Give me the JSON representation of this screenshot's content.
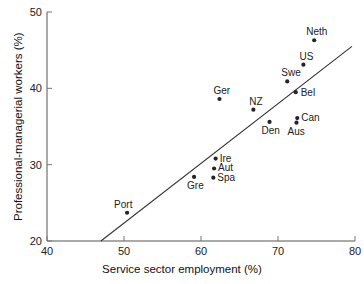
{
  "chart_data": {
    "type": "scatter",
    "title": "",
    "xlabel": "Service sector employment (%)",
    "ylabel": "Professional-managerial workers (%)",
    "xlim": [
      40,
      80
    ],
    "ylim": [
      20,
      50
    ],
    "xticks": [
      40,
      50,
      60,
      70,
      80
    ],
    "yticks": [
      20,
      30,
      40,
      50
    ],
    "grid": false,
    "legend": "none",
    "points": [
      {
        "label": "Port",
        "x": 50.4,
        "y": 23.7,
        "label_dx": -13,
        "label_dy": -14
      },
      {
        "label": "Gre",
        "x": 59.1,
        "y": 28.4,
        "label_dx": -7,
        "label_dy": 3
      },
      {
        "label": "Spa",
        "x": 61.6,
        "y": 28.3,
        "label_dx": 4,
        "label_dy": -6
      },
      {
        "label": "Aut",
        "x": 61.7,
        "y": 29.5,
        "label_dx": 4,
        "label_dy": -6
      },
      {
        "label": "Ire",
        "x": 61.9,
        "y": 30.8,
        "label_dx": 4,
        "label_dy": -6
      },
      {
        "label": "Ger",
        "x": 62.4,
        "y": 38.6,
        "label_dx": -6,
        "label_dy": -14
      },
      {
        "label": "Den",
        "x": 68.9,
        "y": 35.6,
        "label_dx": -8,
        "label_dy": 3
      },
      {
        "label": "NZ",
        "x": 66.8,
        "y": 37.2,
        "label_dx": -4,
        "label_dy": -14
      },
      {
        "label": "Aus",
        "x": 72.4,
        "y": 35.5,
        "label_dx": -9,
        "label_dy": 3
      },
      {
        "label": "Can",
        "x": 72.5,
        "y": 36.1,
        "label_dx": 4,
        "label_dy": -6
      },
      {
        "label": "Bel",
        "x": 72.3,
        "y": 39.5,
        "label_dx": 5,
        "label_dy": -5
      },
      {
        "label": "Swe",
        "x": 71.2,
        "y": 40.9,
        "label_dx": -6,
        "label_dy": -14
      },
      {
        "label": "US",
        "x": 73.3,
        "y": 43.1,
        "label_dx": -4,
        "label_dy": -14
      },
      {
        "label": "Neth",
        "x": 74.7,
        "y": 46.3,
        "label_dx": -8,
        "label_dy": -14
      }
    ],
    "trendline": {
      "x1": 47.0,
      "y1": 20.0,
      "x2": 79.6,
      "y2": 45.5
    }
  },
  "colors": {
    "point": "#23242e",
    "axis": "#555555",
    "trend": "#333333",
    "text": "#222222",
    "background": "#ffffff"
  }
}
